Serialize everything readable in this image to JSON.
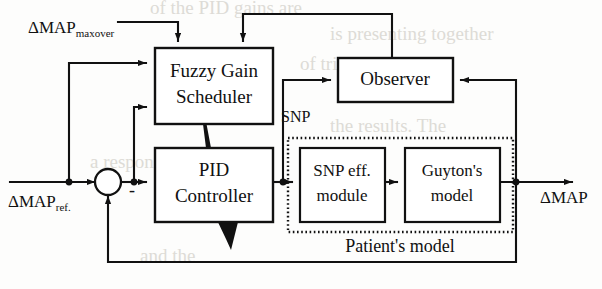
{
  "figure": {
    "type": "block-diagram",
    "width": 602,
    "height": 289,
    "background": "#fdfdfc",
    "line_color": "#111111"
  },
  "blocks": {
    "fuzzy_gain_scheduler": {
      "label_line1": "Fuzzy Gain",
      "label_line2": "Scheduler",
      "x": 155,
      "y": 48,
      "w": 118,
      "h": 76,
      "font_size": 19
    },
    "pid_controller": {
      "label_line1": "PID",
      "label_line2": "Controller",
      "x": 155,
      "y": 148,
      "w": 118,
      "h": 74,
      "font_size": 19
    },
    "observer": {
      "label": "Observer",
      "x": 338,
      "y": 58,
      "w": 115,
      "h": 44,
      "font_size": 19
    },
    "snp_eff_module": {
      "label_line1": "SNP eff.",
      "label_line2": "module",
      "x": 300,
      "y": 148,
      "w": 85,
      "h": 74,
      "font_size": 17
    },
    "guytons_model": {
      "label_line1": "Guyton's",
      "label_line2": "model",
      "x": 405,
      "y": 148,
      "w": 95,
      "h": 74,
      "font_size": 17
    },
    "patients_model_container": {
      "label": "Patient's model",
      "x": 288,
      "y": 138,
      "w": 225,
      "h": 94,
      "label_x": 400,
      "label_y": 248,
      "font_size": 18,
      "border_style": "dotted"
    }
  },
  "signals": {
    "map_maxover": {
      "base": "ΔMAP",
      "subscript": "maxover",
      "x": 28,
      "y": 33,
      "font_size": 17,
      "sub_font_size": 11
    },
    "map_ref": {
      "base": "ΔMAP",
      "subscript": "ref.",
      "x": 8,
      "y": 207,
      "font_size": 17,
      "sub_font_size": 11
    },
    "map_out": {
      "label": "ΔMAP",
      "x": 540,
      "y": 203,
      "font_size": 17
    },
    "snp": {
      "label": "SNP",
      "x": 281,
      "y": 122,
      "font_size": 16
    },
    "minus_sign": {
      "label": "-",
      "x": 129,
      "y": 196,
      "font_size": 18
    }
  },
  "summing_junction": {
    "name": "summing-junction",
    "cx": 108,
    "cy": 182,
    "r": 13
  },
  "junction_dots": [
    {
      "name": "dot-map-ref-branch",
      "cx": 69,
      "cy": 182,
      "r": 3.4
    },
    {
      "name": "dot-error-branch",
      "cx": 134,
      "cy": 182,
      "r": 3.4
    },
    {
      "name": "dot-snp-branch",
      "cx": 283,
      "cy": 182,
      "r": 3.4
    },
    {
      "name": "dot-map-output-branch",
      "cx": 516,
      "cy": 182,
      "r": 3.4
    }
  ],
  "connections": [
    {
      "name": "map-maxover-to-scheduler",
      "from": "ΔMAP maxover input",
      "to": "Fuzzy Gain Scheduler top-left"
    },
    {
      "name": "observer-to-scheduler",
      "from": "Observer top",
      "to": "Fuzzy Gain Scheduler top-right"
    },
    {
      "name": "map-ref-to-scheduler",
      "from": "ΔMAP ref. branch",
      "to": "Fuzzy Gain Scheduler left-upper"
    },
    {
      "name": "error-to-scheduler",
      "from": "error branch",
      "to": "Fuzzy Gain Scheduler left-lower"
    },
    {
      "name": "map-ref-to-sum",
      "from": "ΔMAP ref. input",
      "to": "summing junction"
    },
    {
      "name": "sum-to-pid",
      "from": "summing junction",
      "to": "PID Controller"
    },
    {
      "name": "scheduler-to-pid-gain",
      "from": "Fuzzy Gain Scheduler",
      "to": "PID Controller",
      "style": "tapered-wedge"
    },
    {
      "name": "pid-tuning-wedge",
      "from": "PID Controller bottom",
      "to": "gain adaptation",
      "style": "tapered-wedge"
    },
    {
      "name": "pid-to-snp-module",
      "from": "PID Controller",
      "to": "SNP eff. module"
    },
    {
      "name": "snp-to-observer",
      "from": "SNP branch",
      "to": "Observer left input"
    },
    {
      "name": "snp-module-to-guyton",
      "from": "SNP eff. module",
      "to": "Guyton's model"
    },
    {
      "name": "guyton-to-output",
      "from": "Guyton's model",
      "to": "ΔMAP output"
    },
    {
      "name": "map-to-observer",
      "from": "ΔMAP branch",
      "to": "Observer right input"
    },
    {
      "name": "map-feedback-to-sum",
      "from": "ΔMAP branch",
      "to": "summing junction (negative)"
    }
  ]
}
